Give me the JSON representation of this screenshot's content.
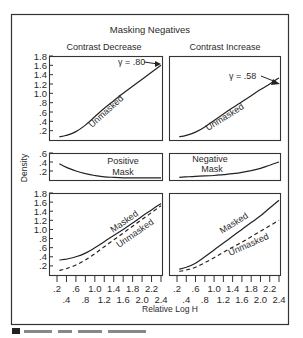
{
  "figure": {
    "title": "Masking Negatives",
    "xlabel": "Relative Log H",
    "ylabel": "Density",
    "caption_partial": "Figure ... Masking negatives"
  },
  "columns": [
    {
      "title": "Contrast Decrease"
    },
    {
      "title": "Contrast Increase"
    }
  ],
  "chart_data": [
    {
      "type": "line",
      "panel": "top-left",
      "title": "Contrast Decrease",
      "xlabel": "Relative Log H",
      "ylabel": "Density",
      "xlim": [
        0.2,
        2.4
      ],
      "ylim": [
        0,
        1.8
      ],
      "yticks": [
        ".2",
        ".4",
        ".6",
        ".8",
        "1.0",
        "1.2",
        "1.4",
        "1.6",
        "1.8"
      ],
      "series": [
        {
          "name": "Unmasked",
          "style": "solid",
          "x": [
            0.25,
            0.4,
            0.6,
            0.8,
            1.0,
            1.2,
            1.4,
            1.6,
            1.8,
            2.0,
            2.2,
            2.4
          ],
          "y": [
            0.07,
            0.1,
            0.18,
            0.32,
            0.5,
            0.68,
            0.84,
            1.0,
            1.15,
            1.3,
            1.45,
            1.6
          ]
        }
      ],
      "annotations": [
        "Unmasked",
        "γ = .80"
      ]
    },
    {
      "type": "line",
      "panel": "top-right",
      "title": "Contrast Increase",
      "xlim": [
        0.2,
        2.4
      ],
      "ylim": [
        0,
        1.8
      ],
      "series": [
        {
          "name": "Unmasked",
          "style": "solid",
          "x": [
            0.25,
            0.4,
            0.6,
            0.8,
            1.0,
            1.2,
            1.4,
            1.6,
            1.8,
            2.0,
            2.2,
            2.4
          ],
          "y": [
            0.07,
            0.1,
            0.17,
            0.28,
            0.42,
            0.56,
            0.69,
            0.82,
            0.95,
            1.08,
            1.2,
            1.33
          ]
        }
      ],
      "annotations": [
        "Unmasked",
        "γ = .58"
      ]
    },
    {
      "type": "line",
      "panel": "middle-left",
      "title": "Positive Mask",
      "xlim": [
        0.2,
        2.4
      ],
      "ylim": [
        0,
        0.6
      ],
      "yticks": [
        ".2",
        ".4",
        ".6"
      ],
      "series": [
        {
          "name": "Positive Mask",
          "style": "solid",
          "x": [
            0.25,
            0.4,
            0.6,
            0.8,
            1.0,
            1.2,
            1.4,
            1.6,
            1.8,
            2.0,
            2.2,
            2.4
          ],
          "y": [
            0.36,
            0.28,
            0.2,
            0.14,
            0.1,
            0.07,
            0.06,
            0.05,
            0.05,
            0.05,
            0.05,
            0.05
          ]
        }
      ],
      "annotations": [
        "Positive",
        "Mask"
      ]
    },
    {
      "type": "line",
      "panel": "middle-right",
      "title": "Negative Mask",
      "xlim": [
        0.2,
        2.4
      ],
      "ylim": [
        0,
        0.6
      ],
      "series": [
        {
          "name": "Negative Mask",
          "style": "solid",
          "x": [
            0.25,
            0.4,
            0.6,
            0.8,
            1.0,
            1.2,
            1.4,
            1.6,
            1.8,
            2.0,
            2.2,
            2.4
          ],
          "y": [
            0.06,
            0.07,
            0.08,
            0.09,
            0.1,
            0.12,
            0.14,
            0.17,
            0.21,
            0.26,
            0.33,
            0.4
          ]
        }
      ],
      "annotations": [
        "Negative",
        "Mask"
      ]
    },
    {
      "type": "line",
      "panel": "bottom-left",
      "xlim": [
        0.2,
        2.4
      ],
      "ylim": [
        0,
        1.8
      ],
      "xticks_top": [
        ".2",
        ".6",
        "1.0",
        "1.4",
        "1.8",
        "2.2"
      ],
      "xticks_bottom": [
        ".4",
        ".8",
        "1.2",
        "1.6",
        "2.0",
        "2.4"
      ],
      "series": [
        {
          "name": "Masked",
          "style": "solid",
          "x": [
            0.25,
            0.4,
            0.6,
            0.8,
            1.0,
            1.2,
            1.4,
            1.6,
            1.8,
            2.0,
            2.2,
            2.4
          ],
          "y": [
            0.33,
            0.35,
            0.4,
            0.48,
            0.6,
            0.73,
            0.87,
            1.0,
            1.14,
            1.29,
            1.43,
            1.57
          ]
        },
        {
          "name": "Unmasked",
          "style": "dashed",
          "x": [
            0.25,
            0.4,
            0.6,
            0.8,
            1.0,
            1.2,
            1.4,
            1.6,
            1.8,
            2.0,
            2.2,
            2.4
          ],
          "y": [
            0.1,
            0.14,
            0.22,
            0.33,
            0.47,
            0.62,
            0.77,
            0.92,
            1.07,
            1.22,
            1.37,
            1.52
          ]
        }
      ],
      "annotations": [
        "Masked",
        "Unmasked"
      ]
    },
    {
      "type": "line",
      "panel": "bottom-right",
      "xlim": [
        0.2,
        2.4
      ],
      "ylim": [
        0,
        1.8
      ],
      "xticks_top": [
        ".2",
        ".6",
        "1.0",
        "1.4",
        "1.8",
        "2.2"
      ],
      "xticks_bottom": [
        ".4",
        ".8",
        "1.2",
        "1.6",
        "2.0",
        "2.4"
      ],
      "series": [
        {
          "name": "Masked",
          "style": "solid",
          "x": [
            0.25,
            0.4,
            0.6,
            0.8,
            1.0,
            1.2,
            1.4,
            1.6,
            1.8,
            2.0,
            2.2,
            2.4
          ],
          "y": [
            0.13,
            0.17,
            0.26,
            0.4,
            0.55,
            0.7,
            0.85,
            1.0,
            1.15,
            1.3,
            1.47,
            1.64
          ]
        },
        {
          "name": "Unmasked",
          "style": "dashed",
          "x": [
            0.25,
            0.4,
            0.6,
            0.8,
            1.0,
            1.2,
            1.4,
            1.6,
            1.8,
            2.0,
            2.2,
            2.4
          ],
          "y": [
            0.08,
            0.11,
            0.17,
            0.27,
            0.38,
            0.5,
            0.61,
            0.72,
            0.84,
            0.96,
            1.08,
            1.2
          ]
        }
      ],
      "annotations": [
        "Masked",
        "Unmasked"
      ]
    }
  ],
  "labels": {
    "y_top": [
      ".2",
      ".4",
      ".6",
      ".8",
      "1.0",
      "1.2",
      "1.4",
      "1.6",
      "1.8"
    ],
    "y_mid": [
      ".2",
      ".4",
      ".6"
    ],
    "x_row1": [
      ".2",
      ".6",
      "1.0",
      "1.4",
      "1.8",
      "2.2"
    ],
    "x_row2": [
      ".4",
      ".8",
      "1.2",
      "1.6",
      "2.0",
      "2.4"
    ],
    "gamma_left": "γ = .80",
    "gamma_right": "γ = .58",
    "unmasked": "Unmasked",
    "masked": "Masked",
    "positive": "Positive",
    "negative": "Negative",
    "mask": "Mask"
  }
}
